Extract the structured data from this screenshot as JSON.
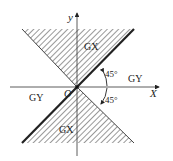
{
  "diagram": {
    "axes": {
      "x_label": "X",
      "y_label": "y",
      "origin_label": "O"
    },
    "regions": {
      "upper_shaded_label": "GX",
      "lower_shaded_label": "GX",
      "right_label": "GY",
      "left_label": "GY"
    },
    "angles": {
      "upper_angle_label": "45°",
      "lower_angle_label": "45°"
    },
    "colors": {
      "line": "#222222",
      "hatch": "#333333",
      "background": "#ffffff"
    }
  }
}
